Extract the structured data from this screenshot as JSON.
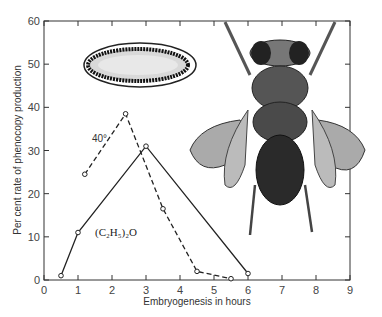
{
  "chart_data": {
    "type": "line",
    "title": "",
    "xlabel": "Embryogenesis in hours",
    "ylabel": "Per cent rate of phenocopy production",
    "xlim": [
      0,
      9
    ],
    "ylim": [
      0,
      60
    ],
    "x_ticks": [
      "0",
      "1",
      "2",
      "3",
      "4",
      "5",
      "6",
      "7",
      "8",
      "9"
    ],
    "y_ticks": [
      "0",
      "10",
      "20",
      "30",
      "40",
      "50",
      "60"
    ],
    "grid": false,
    "series": [
      {
        "name": "(C2H5)2O",
        "style": "solid",
        "label": "(C₂H₅)₂O",
        "x": [
          0.5,
          1,
          3,
          6
        ],
        "y": [
          1,
          11,
          31,
          1.5
        ]
      },
      {
        "name": "40°",
        "style": "dashed",
        "label": "40°",
        "x": [
          1.2,
          2.4,
          3.5,
          4.5,
          5.5
        ],
        "y": [
          24.5,
          38.5,
          16.5,
          2,
          0.3
        ]
      }
    ],
    "annotations": [
      "Egg illustration (upper left)",
      "Drosophila fly illustration with crumpled wings (right)"
    ]
  }
}
